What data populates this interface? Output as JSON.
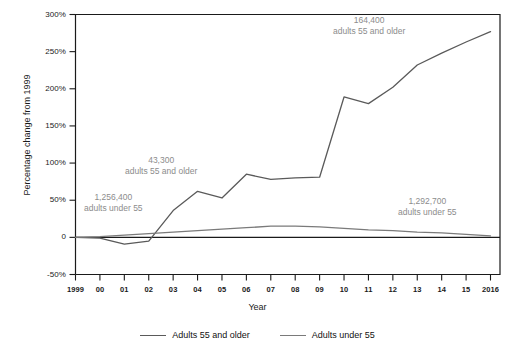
{
  "chart_data": {
    "type": "line",
    "title": "",
    "xlabel": "Year",
    "ylabel": "Percentage change from 1999",
    "x": [
      1999,
      2000,
      2001,
      2002,
      2003,
      2004,
      2005,
      2006,
      2007,
      2008,
      2009,
      2010,
      2011,
      2012,
      2013,
      2014,
      2015,
      2016
    ],
    "xtick_labels": [
      "1999",
      "00",
      "01",
      "02",
      "03",
      "04",
      "05",
      "06",
      "07",
      "08",
      "09",
      "10",
      "11",
      "12",
      "13",
      "14",
      "15",
      "2016"
    ],
    "ytick_labels": [
      "300%",
      "250%",
      "200%",
      "150%",
      "100%",
      "50%",
      "0",
      "-50%"
    ],
    "ytick_values": [
      300,
      250,
      200,
      150,
      100,
      50,
      0,
      -50
    ],
    "ylim": [
      -50,
      300
    ],
    "xlim": [
      1999,
      2016
    ],
    "grid": false,
    "legend_position": "bottom",
    "series": [
      {
        "name": "Adults 55 and older",
        "color": "#5a5a5a",
        "values": [
          0,
          -1,
          -9,
          -5,
          36,
          62,
          53,
          85,
          78,
          80,
          81,
          189,
          180,
          202,
          232,
          248,
          263,
          277
        ]
      },
      {
        "name": "Adults under 55",
        "color": "#7a7a7a",
        "values": [
          0,
          1,
          3,
          5,
          7,
          9,
          11,
          13,
          15,
          15,
          14,
          12,
          10,
          9,
          7,
          6,
          4,
          2
        ]
      }
    ],
    "annotations": [
      {
        "id": "annotation-older-early",
        "line1": "43,300",
        "line2": "adults 55 and older",
        "left": 125,
        "top": 155
      },
      {
        "id": "annotation-under-early",
        "line1": "1,256,400",
        "line2": "adults under 55",
        "left": 84,
        "top": 192
      },
      {
        "id": "annotation-older-late",
        "line1": "164,400",
        "line2": "adults 55 and older",
        "left": 333,
        "top": 15
      },
      {
        "id": "annotation-under-late",
        "line1": "1,292,700",
        "line2": "adults under 55",
        "left": 398,
        "top": 196
      }
    ]
  },
  "legend": {
    "entries": [
      {
        "label": "Adults 55 and older",
        "color": "#5a5a5a"
      },
      {
        "label": "Adults under 55",
        "color": "#7a7a7a"
      }
    ]
  }
}
